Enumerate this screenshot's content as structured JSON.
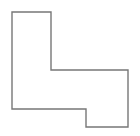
{
  "canvas": {
    "width": 140,
    "height": 136,
    "background_color": "#ffffff"
  },
  "figure": {
    "name": "stepped-polygon-outline",
    "shape_type": "polygon",
    "vertex_count": 8,
    "filled": false,
    "fill_color": "none",
    "stroke_color": "#777777",
    "stroke_width": 1.4,
    "points_string": "12,12 51,12 51,70 128,70 128,127 86,127 86,109 12,109",
    "vertices": [
      {
        "label": "top-left",
        "x": 12,
        "y": 12
      },
      {
        "label": "top-right-of-upper-arm",
        "x": 51,
        "y": 12
      },
      {
        "label": "inner-notch-corner",
        "x": 51,
        "y": 70
      },
      {
        "label": "top-right",
        "x": 128,
        "y": 70
      },
      {
        "label": "bottom-right",
        "x": 128,
        "y": 127
      },
      {
        "label": "bottom-step-right",
        "x": 86,
        "y": 127
      },
      {
        "label": "bottom-step-up",
        "x": 86,
        "y": 109
      },
      {
        "label": "bottom-left",
        "x": 12,
        "y": 109
      }
    ]
  }
}
